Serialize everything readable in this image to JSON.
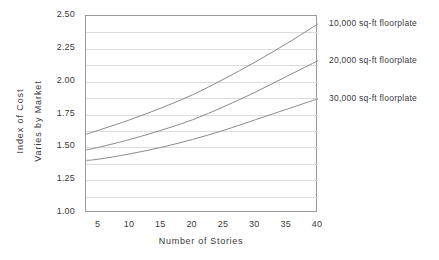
{
  "chart_data": {
    "type": "line",
    "title": "",
    "xlabel": "Number of Stories",
    "ylabel_line1": "Index of Cost",
    "ylabel_line2": "Varies by Market",
    "xlim": [
      3,
      40
    ],
    "ylim": [
      1.0,
      2.5
    ],
    "x_ticks": [
      5,
      10,
      15,
      20,
      25,
      30,
      35,
      40
    ],
    "x_tick_labels": [
      "5",
      "10",
      "15",
      "20",
      "25",
      "30",
      "35",
      "40"
    ],
    "y_ticks": [
      1.0,
      1.25,
      1.5,
      1.75,
      2.0,
      2.25,
      2.5
    ],
    "y_tick_labels": [
      "1.00",
      "1.25",
      "1.50",
      "1.75",
      "2.00",
      "2.25",
      "2.50"
    ],
    "y_gridline_step": 0.125,
    "grid": "horizontal",
    "legend_position": "right-inline-annotations",
    "x": [
      3,
      5,
      10,
      15,
      20,
      25,
      30,
      35,
      40
    ],
    "series": [
      {
        "name": "10,000 sq-ft floorplate",
        "label": "10,000  sq-ft floorplate",
        "color": "#8a8a8a",
        "values": [
          1.6,
          1.63,
          1.71,
          1.8,
          1.9,
          2.02,
          2.15,
          2.29,
          2.44
        ]
      },
      {
        "name": "20,000 sq-ft floorplate",
        "label": "20,000  sq-ft floorplate",
        "color": "#8a8a8a",
        "values": [
          1.48,
          1.5,
          1.56,
          1.63,
          1.71,
          1.81,
          1.92,
          2.04,
          2.16
        ]
      },
      {
        "name": "30,000 sq-ft floorplate",
        "label": "30,000  sq-ft floorplate",
        "color": "#8a8a8a",
        "values": [
          1.4,
          1.41,
          1.45,
          1.5,
          1.56,
          1.63,
          1.71,
          1.79,
          1.87
        ]
      }
    ],
    "colors": {
      "axis": "#9a9a9a",
      "grid": "#dcdcdc",
      "line": "#8a8a8a",
      "text": "#3a3a3a",
      "background": "#ffffff"
    }
  }
}
